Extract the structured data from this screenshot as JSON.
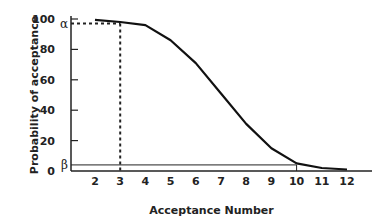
{
  "chart_data": {
    "type": "line",
    "title": "",
    "xlabel": "Acceptance Number",
    "ylabel": "Probability of acceptance",
    "x": [
      2,
      3,
      4,
      5,
      6,
      7,
      8,
      9,
      10,
      11,
      12
    ],
    "series": [
      {
        "name": "OC curve",
        "values": [
          99.5,
          98,
          96,
          86,
          71,
          51,
          31,
          15,
          5,
          2,
          1
        ]
      }
    ],
    "x_ticks": [
      "2",
      "3",
      "4",
      "5",
      "6",
      "7",
      "8",
      "9",
      "10",
      "11",
      "12"
    ],
    "y_ticks": [
      "0",
      "20",
      "40",
      "60",
      "80",
      "100"
    ],
    "ylim": [
      0,
      100
    ],
    "xlim": [
      1,
      13
    ],
    "grid": false,
    "annotations": [
      {
        "label": "α",
        "y": 97,
        "style": "dotted horizontal to x=3",
        "x_drop": 3
      },
      {
        "label": "β",
        "y": 4,
        "style": "solid horizontal to x=10",
        "x_drop": 10
      }
    ]
  }
}
